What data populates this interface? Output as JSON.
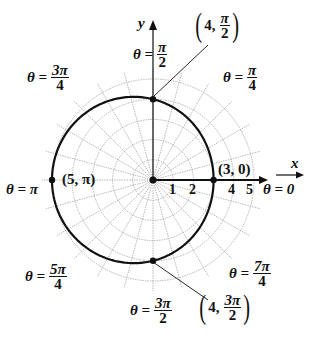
{
  "diagram": {
    "type": "polar graph",
    "curve": "r = 4 - cos(theta)",
    "axis_labels": {
      "x": "x",
      "y": "y"
    },
    "radial_ticks": [
      "1",
      "2",
      "4",
      "5"
    ],
    "angle_labels": {
      "a0": {
        "prefix": "θ = 0"
      },
      "a45": {
        "prefix": "θ =",
        "num": "π",
        "den": "4"
      },
      "a90": {
        "prefix": "θ =",
        "num": "π",
        "den": "2"
      },
      "a135": {
        "prefix": "θ =",
        "num": "3π",
        "den": "4"
      },
      "a180": {
        "prefix": "θ = π"
      },
      "a225": {
        "prefix": "θ =",
        "num": "5π",
        "den": "4"
      },
      "a270": {
        "prefix": "θ =",
        "num": "3π",
        "den": "2"
      },
      "a315": {
        "prefix": "θ =",
        "num": "7π",
        "den": "4"
      }
    },
    "points": {
      "p1": {
        "label": "(3, 0)"
      },
      "p2": {
        "label": "(5, π)"
      },
      "p3": {
        "r": "4,",
        "num": "π",
        "den": "2"
      },
      "p4": {
        "r": "4,",
        "num": "3π",
        "den": "2"
      }
    },
    "colors": {
      "curve": "#111111",
      "grid": "#9a9a9a",
      "text": "#111111"
    }
  }
}
